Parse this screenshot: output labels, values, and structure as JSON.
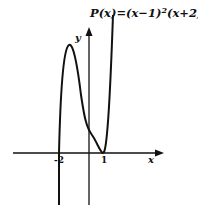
{
  "title_parts": {
    "p": "P(x)=(x−1)",
    "sq1": "2",
    "mid": "(x+2)(x",
    "sq2": "2",
    "end": "+1)"
  },
  "axes": {
    "x_label": "x",
    "y_label": "y"
  },
  "ticks": {
    "neg2": "-2",
    "one": "1"
  },
  "colors": {
    "curve": "#111111",
    "axis": "#111111",
    "background": "#ffffff"
  }
}
